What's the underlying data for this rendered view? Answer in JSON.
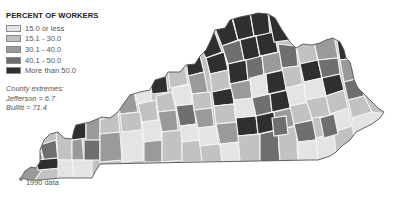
{
  "legend": {
    "title": "PERCENT OF WORKERS",
    "items": [
      {
        "label": "15.0 or less",
        "color": "#e4e4e4"
      },
      {
        "label": "15.1 - 30.0",
        "color": "#c2c2c2"
      },
      {
        "label": "30.1 - 40.0",
        "color": "#9a9a9a"
      },
      {
        "label": "40.1 - 50.0",
        "color": "#6f6f6f"
      },
      {
        "label": "More than 50.0",
        "color": "#2f2f2f"
      }
    ]
  },
  "extremes": {
    "heading": "County extremes:",
    "lines": [
      "Jefferson = 6.7",
      "Bullitt = 71.4"
    ]
  },
  "footnote": "1990 data",
  "map": {
    "region": "Kentucky counties",
    "outline_color": "#555555",
    "border_color": "#f2f2f2"
  }
}
